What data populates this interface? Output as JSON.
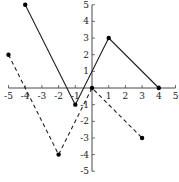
{
  "chart_data": {
    "type": "line",
    "title": "",
    "xlabel": "",
    "ylabel": "",
    "xlim": [
      -5,
      5
    ],
    "ylim": [
      -5,
      5
    ],
    "grid": false,
    "x_ticks": [
      -5,
      -4,
      -3,
      -2,
      -1,
      1,
      2,
      3,
      4,
      5
    ],
    "y_ticks": [
      -5,
      -4,
      -3,
      -2,
      -1,
      1,
      2,
      3,
      4,
      5
    ],
    "series": [
      {
        "name": "solid",
        "style": "solid",
        "color": "#222222",
        "points": [
          [
            -4,
            5
          ],
          [
            -1,
            -1
          ],
          [
            1,
            3
          ],
          [
            4,
            0
          ]
        ]
      },
      {
        "name": "dashed",
        "style": "dashed",
        "color": "#222222",
        "points": [
          [
            -5,
            2
          ],
          [
            -2,
            -4
          ],
          [
            0,
            0
          ],
          [
            3,
            -3
          ]
        ]
      }
    ]
  }
}
